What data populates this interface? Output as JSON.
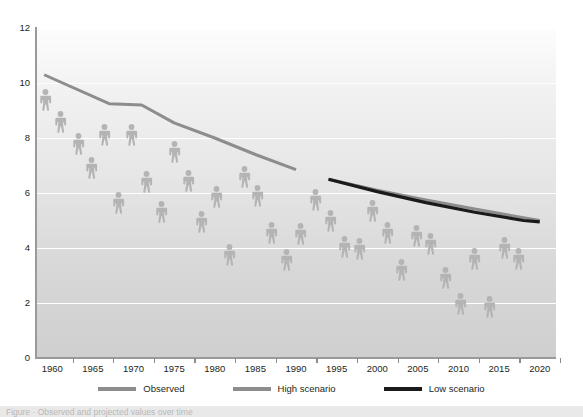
{
  "chart_data": {
    "type": "scatter",
    "title": "",
    "subtitle": "",
    "xlabel": "",
    "ylabel": "",
    "xlim": [
      1958,
      2022
    ],
    "ylim": [
      0,
      12
    ],
    "grid": true,
    "grid_axis": "y",
    "legend_position": "bottom-center",
    "marker_style": "person-pictogram",
    "y_ticks": [
      0,
      2,
      4,
      6,
      8,
      10,
      12
    ],
    "y_tick_labels": [
      "0",
      "2",
      "4",
      "6",
      "8",
      "10",
      "12"
    ],
    "x_ticks": [
      1960,
      1965,
      1970,
      1975,
      1980,
      1985,
      1990,
      1995,
      2000,
      2005,
      2010,
      2015,
      2020
    ],
    "x_tick_labels": [
      "1960",
      "1965",
      "1970",
      "1975",
      "1980",
      "1985",
      "1990",
      "1995",
      "2000",
      "2005",
      "2010",
      "2015",
      "2020"
    ],
    "colors": {
      "observed": "#8d8d8d",
      "high_scenario": "#8d8d8d",
      "low_scenario": "#1a1a1a",
      "pictogram": "#b4b4b4",
      "gridline": "#ffffff",
      "axis": "#9a9a9a",
      "text": "#231f20"
    },
    "series": [
      {
        "name": "Observed",
        "type": "line",
        "color": "#8d8d8d",
        "x": [
          1959,
          1967,
          1971,
          1975,
          1980,
          1985,
          1990
        ],
        "values": [
          10.3,
          9.25,
          9.2,
          8.55,
          8.0,
          7.4,
          6.85
        ]
      },
      {
        "name": "High scenario",
        "type": "line",
        "color": "#8d8d8d",
        "x": [
          1994,
          2000,
          2006,
          2012,
          2018,
          2020
        ],
        "values": [
          6.5,
          6.1,
          5.75,
          5.42,
          5.1,
          5.0
        ]
      },
      {
        "name": "Low scenario",
        "type": "line",
        "color": "#1a1a1a",
        "x": [
          1994,
          2000,
          2006,
          2012,
          2018,
          2020
        ],
        "values": [
          6.5,
          6.05,
          5.65,
          5.3,
          5.0,
          4.95
        ]
      },
      {
        "name": "Pictogram observations",
        "type": "scatter",
        "color": "#b4b4b4",
        "points": [
          {
            "x": 1959.2,
            "y": 9.4
          },
          {
            "x": 1961.0,
            "y": 8.6
          },
          {
            "x": 1963.2,
            "y": 7.8
          },
          {
            "x": 1964.8,
            "y": 6.9
          },
          {
            "x": 1966.4,
            "y": 8.1
          },
          {
            "x": 1968.2,
            "y": 5.65
          },
          {
            "x": 1969.8,
            "y": 8.1
          },
          {
            "x": 1971.6,
            "y": 6.4
          },
          {
            "x": 1973.4,
            "y": 5.3
          },
          {
            "x": 1975.0,
            "y": 7.5
          },
          {
            "x": 1976.8,
            "y": 6.45
          },
          {
            "x": 1978.4,
            "y": 4.95
          },
          {
            "x": 1980.2,
            "y": 5.85
          },
          {
            "x": 1981.8,
            "y": 3.75
          },
          {
            "x": 1983.6,
            "y": 6.6
          },
          {
            "x": 1985.2,
            "y": 5.9
          },
          {
            "x": 1987.0,
            "y": 4.55
          },
          {
            "x": 1988.8,
            "y": 3.55
          },
          {
            "x": 1990.6,
            "y": 4.5
          },
          {
            "x": 1992.4,
            "y": 5.75
          },
          {
            "x": 1994.2,
            "y": 5.0
          },
          {
            "x": 1996.0,
            "y": 4.05
          },
          {
            "x": 1997.8,
            "y": 3.95
          },
          {
            "x": 1999.4,
            "y": 5.35
          },
          {
            "x": 2001.2,
            "y": 4.55
          },
          {
            "x": 2003.0,
            "y": 3.2
          },
          {
            "x": 2004.8,
            "y": 4.45
          },
          {
            "x": 2006.6,
            "y": 4.15
          },
          {
            "x": 2008.4,
            "y": 2.9
          },
          {
            "x": 2010.2,
            "y": 1.95
          },
          {
            "x": 2012.0,
            "y": 3.6
          },
          {
            "x": 2013.8,
            "y": 1.85
          },
          {
            "x": 2015.6,
            "y": 4.0
          },
          {
            "x": 2017.4,
            "y": 3.6
          }
        ]
      }
    ]
  },
  "legend": {
    "items": [
      {
        "label": "Observed",
        "color": "#8d8d8d",
        "thickness": "3.2px"
      },
      {
        "label": "High scenario",
        "color": "#8d8d8d",
        "thickness": "3.2px"
      },
      {
        "label": "Low scenario",
        "color": "#1a1a1a",
        "thickness": "3.6px"
      }
    ]
  },
  "caption": {
    "text": "Figure  ·  Observed and projected values over time"
  }
}
